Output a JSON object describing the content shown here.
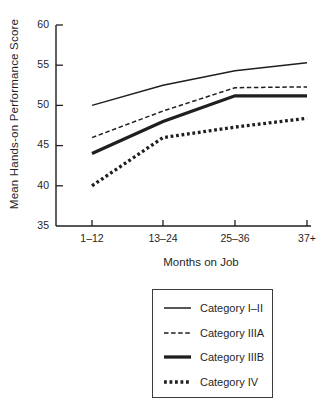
{
  "chart_data": {
    "type": "line",
    "title": "",
    "xlabel": "Months on Job",
    "ylabel": "Mean Hands-on Performance Score",
    "categories": [
      "1–12",
      "13–24",
      "25–36",
      "37+"
    ],
    "ylim": [
      35,
      60
    ],
    "yticks": [
      35,
      40,
      45,
      50,
      55,
      60
    ],
    "grid": false,
    "legend_position": "below-chart-right",
    "line_color": "#1f1f1f",
    "series": [
      {
        "name": "Category I–II",
        "style": "thin-solid",
        "stroke_width": 1.5,
        "dash": "none",
        "values": [
          50.0,
          52.5,
          54.3,
          55.3
        ]
      },
      {
        "name": "Category IIIA",
        "style": "thin-dashed",
        "stroke_width": 1.5,
        "dash": "4.5 2.6",
        "values": [
          46.0,
          49.3,
          52.2,
          52.3
        ]
      },
      {
        "name": "Category IIIB",
        "style": "thick-solid",
        "stroke_width": 3.3,
        "dash": "none",
        "values": [
          44.0,
          48.0,
          51.2,
          51.2
        ]
      },
      {
        "name": "Category IV",
        "style": "thick-dotted",
        "stroke_width": 3.3,
        "dash": "2.8 2.7",
        "values": [
          40.0,
          46.0,
          47.3,
          48.4
        ]
      }
    ]
  }
}
